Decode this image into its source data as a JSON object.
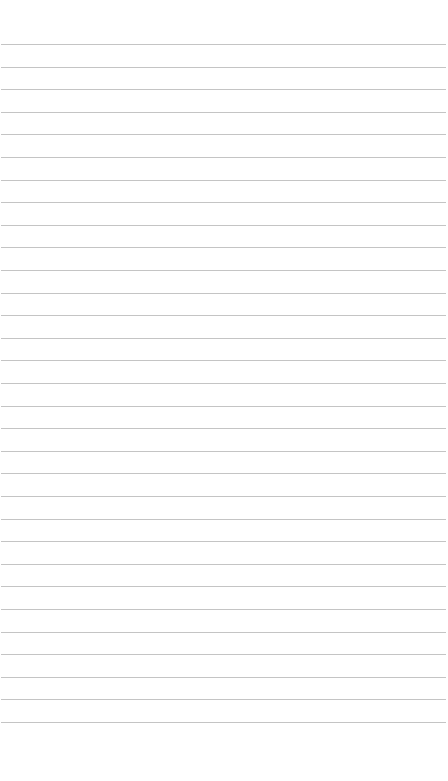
{
  "page": {
    "type": "lined-paper",
    "background": "#ffffff",
    "line_color": "#c4c4c4",
    "line_count": 31,
    "first_line_y": 44,
    "line_spacing": 22.6,
    "lines": []
  }
}
